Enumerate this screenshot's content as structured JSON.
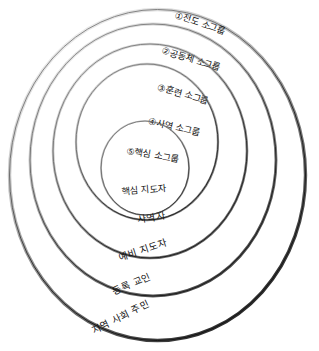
{
  "diagram": {
    "type": "concentric-circles",
    "title_visible": false,
    "background_color": "#ffffff",
    "stroke_color_light": "#8c8c8c",
    "stroke_color_dark": "#1a1a1a",
    "rings": [
      {
        "index": 1,
        "group_label": "①전도 소그룹",
        "member_label": "지역 사회 주민",
        "cx": 157.5,
        "cy": 175.0,
        "rx": 148.0,
        "ry": 165.5,
        "group_label_y": 26,
        "member_label_y": 317
      },
      {
        "index": 2,
        "group_label": "②공동체 소그룹",
        "member_label": "등록 교인",
        "cx": 153.0,
        "cy": 160.0,
        "rx": 123.0,
        "ry": 136.0,
        "group_label_y": 62,
        "member_label_y": 284
      },
      {
        "index": 3,
        "group_label": "③훈련 소그룹",
        "member_label": "예비 지도자",
        "cx": 150.0,
        "cy": 151.0,
        "rx": 97.0,
        "ry": 107.0,
        "group_label_y": 97,
        "member_label_y": 250
      },
      {
        "index": 4,
        "group_label": "④사역 소그룹",
        "member_label": "사역자",
        "cx": 147.0,
        "cy": 142.0,
        "rx": 71.0,
        "ry": 78.0,
        "group_label_y": 130,
        "member_label_y": 219
      },
      {
        "index": 5,
        "group_label": "⑤핵심 소그룹",
        "member_label": "핵심 지도자",
        "cx": 145.0,
        "cy": 168.0,
        "rx": 44.0,
        "ry": 47.0,
        "group_label_y": 160,
        "member_label_y": 190
      }
    ]
  }
}
